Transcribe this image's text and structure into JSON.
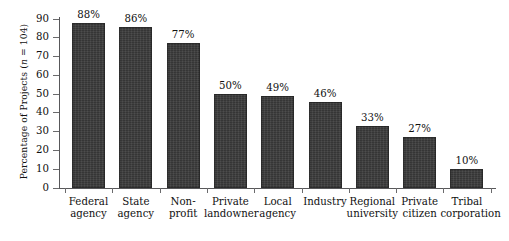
{
  "chart_data": {
    "type": "bar",
    "title": "",
    "subtitle": "",
    "xlabel": "",
    "ylabel": "Percentage of Projects (n = 104)",
    "ylabel_parts": {
      "before": "Percentage of Projects (",
      "italic": "n",
      "after": " = 104)"
    },
    "sample_size": 104,
    "ylim": [
      0,
      90
    ],
    "ytick_values": [
      90,
      80,
      70,
      60,
      50,
      40,
      30,
      20,
      10,
      0
    ],
    "ytick_labels": [
      "90",
      "80",
      "70",
      "60",
      "50",
      "40",
      "30",
      "20",
      "10",
      "0"
    ],
    "grid": false,
    "legend": false,
    "legend_position": "none",
    "value_label_suffix": "%",
    "bar_color": "#3b3b3b",
    "axis_color": "#58585a",
    "background_color": "#ffffff",
    "categories": [
      "Federal agency",
      "State agency",
      "Non-profit",
      "Private landowner",
      "Local agency",
      "Industry",
      "Regional university",
      "Private citizen",
      "Tribal corporation"
    ],
    "category_lines": [
      [
        "Federal",
        "agency"
      ],
      [
        "State",
        "agency"
      ],
      [
        "Non-",
        "profit"
      ],
      [
        "Private",
        "landowner"
      ],
      [
        "Local",
        "agency"
      ],
      [
        "Industry"
      ],
      [
        "Regional",
        "university"
      ],
      [
        "Private",
        "citizen"
      ],
      [
        "Tribal",
        "corporation"
      ]
    ],
    "values": [
      88,
      86,
      77,
      50,
      49,
      46,
      33,
      27,
      10
    ],
    "value_labels": [
      "88%",
      "86%",
      "77%",
      "50%",
      "49%",
      "46%",
      "33%",
      "27%",
      "10%"
    ]
  }
}
